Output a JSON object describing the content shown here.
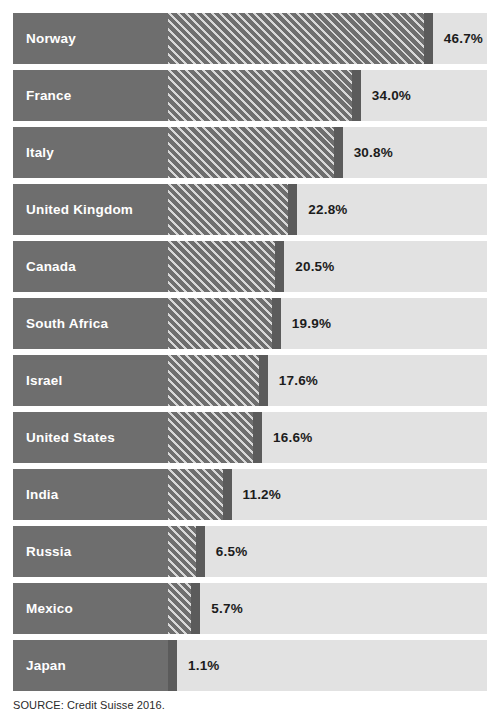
{
  "page": {
    "title_remnant": "",
    "source_note": "SOURCE: Credit Suisse 2016.",
    "background_color": "#ffffff",
    "track_color": "#e2e2e2",
    "bar_color": "#6e6e6e",
    "bar_cap_color": "#5b5b5b",
    "hatch_color": "#d8d8d8",
    "label_text_color": "#ffffff",
    "value_text_color": "#1c1c1c"
  },
  "chart_data": {
    "type": "bar",
    "orientation": "horizontal",
    "title": "",
    "subtitle": "",
    "xlabel": "",
    "ylabel": "",
    "xlim": [
      0,
      56
    ],
    "grid": false,
    "legend": null,
    "value_suffix": "%",
    "source": "SOURCE: Credit Suisse 2016.",
    "categories": [
      "Norway",
      "France",
      "Italy",
      "United Kingdom",
      "Canada",
      "South Africa",
      "Israel",
      "United States",
      "India",
      "Russia",
      "Mexico",
      "Japan"
    ],
    "values": [
      46.7,
      34.0,
      30.8,
      22.8,
      20.5,
      19.9,
      17.6,
      16.6,
      11.2,
      6.5,
      5.7,
      1.1
    ],
    "value_labels": [
      "46.7%",
      "34.0%",
      "30.8%",
      "22.8%",
      "20.5%",
      "19.9%",
      "17.6%",
      "16.6%",
      "11.2%",
      "6.5%",
      "5.7%",
      "1.1%"
    ]
  },
  "rows": [
    {
      "label": "Norway",
      "value": 46.7,
      "value_label": "46.7%"
    },
    {
      "label": "France",
      "value": 34.0,
      "value_label": "34.0%"
    },
    {
      "label": "Italy",
      "value": 30.8,
      "value_label": "30.8%"
    },
    {
      "label": "United Kingdom",
      "value": 22.8,
      "value_label": "22.8%"
    },
    {
      "label": "Canada",
      "value": 20.5,
      "value_label": "20.5%"
    },
    {
      "label": "South Africa",
      "value": 19.9,
      "value_label": "19.9%"
    },
    {
      "label": "Israel",
      "value": 17.6,
      "value_label": "17.6%"
    },
    {
      "label": "United States",
      "value": 16.6,
      "value_label": "16.6%"
    },
    {
      "label": "India",
      "value": 11.2,
      "value_label": "11.2%"
    },
    {
      "label": "Russia",
      "value": 6.5,
      "value_label": "6.5%"
    },
    {
      "label": "Mexico",
      "value": 5.7,
      "value_label": "5.7%"
    },
    {
      "label": "Japan",
      "value": 1.1,
      "value_label": "1.1%"
    }
  ]
}
